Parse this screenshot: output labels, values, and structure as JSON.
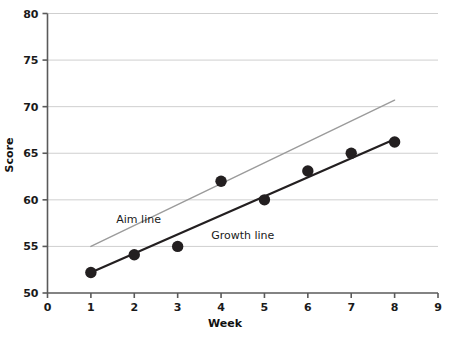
{
  "chart_data": {
    "type": "scatter",
    "title": "",
    "subtitle": "",
    "xlabel": "Week",
    "ylabel": "Score",
    "xlim": [
      0,
      9
    ],
    "ylim": [
      50,
      80
    ],
    "x_ticks": [
      0,
      1,
      2,
      3,
      4,
      5,
      6,
      7,
      8,
      9
    ],
    "x_tick_labels": [
      "0",
      "1",
      "2",
      "3",
      "4",
      "5",
      "6",
      "7",
      "8",
      "9"
    ],
    "y_ticks": [
      50,
      55,
      60,
      65,
      70,
      75,
      80
    ],
    "y_tick_labels": [
      "50",
      "55",
      "60",
      "65",
      "70",
      "75",
      "80"
    ],
    "grid": true,
    "grid_axis": "y",
    "legend_position": "inline-annotations",
    "x": [
      1,
      2,
      3,
      4,
      5,
      6,
      7,
      8
    ],
    "values": [
      52.2,
      54.1,
      55.0,
      62.0,
      60.0,
      63.1,
      65.0,
      66.2
    ],
    "series": [
      {
        "name": "Data points",
        "type": "scatter",
        "x": [
          1,
          2,
          3,
          4,
          5,
          6,
          7,
          8
        ],
        "values": [
          52.2,
          54.1,
          55.0,
          62.0,
          60.0,
          63.1,
          65.0,
          66.2
        ],
        "color": "#231f20",
        "marker": "circle",
        "marker_size": 7
      },
      {
        "name": "Growth line",
        "type": "line",
        "x": [
          1,
          8
        ],
        "values": [
          52.2,
          66.5
        ],
        "color": "#231f20",
        "width": 2.2
      },
      {
        "name": "Aim line",
        "type": "line",
        "x": [
          1,
          8
        ],
        "values": [
          55.0,
          70.7
        ],
        "color": "#9b9b9b",
        "width": 1.4
      }
    ],
    "annotations": [
      {
        "text": "Aim line",
        "x": 2.1,
        "y": 57.5,
        "color": "#1a1a1a"
      },
      {
        "text": "Growth line",
        "x": 4.5,
        "y": 55.8,
        "color": "#1a1a1a"
      }
    ],
    "colors": {
      "axis": "#5a5a5a",
      "grid": "#cfcfcf",
      "growth_line": "#231f20",
      "aim_line": "#9b9b9b",
      "marker": "#231f20",
      "text": "#1a1a1a",
      "background": "#ffffff"
    }
  }
}
